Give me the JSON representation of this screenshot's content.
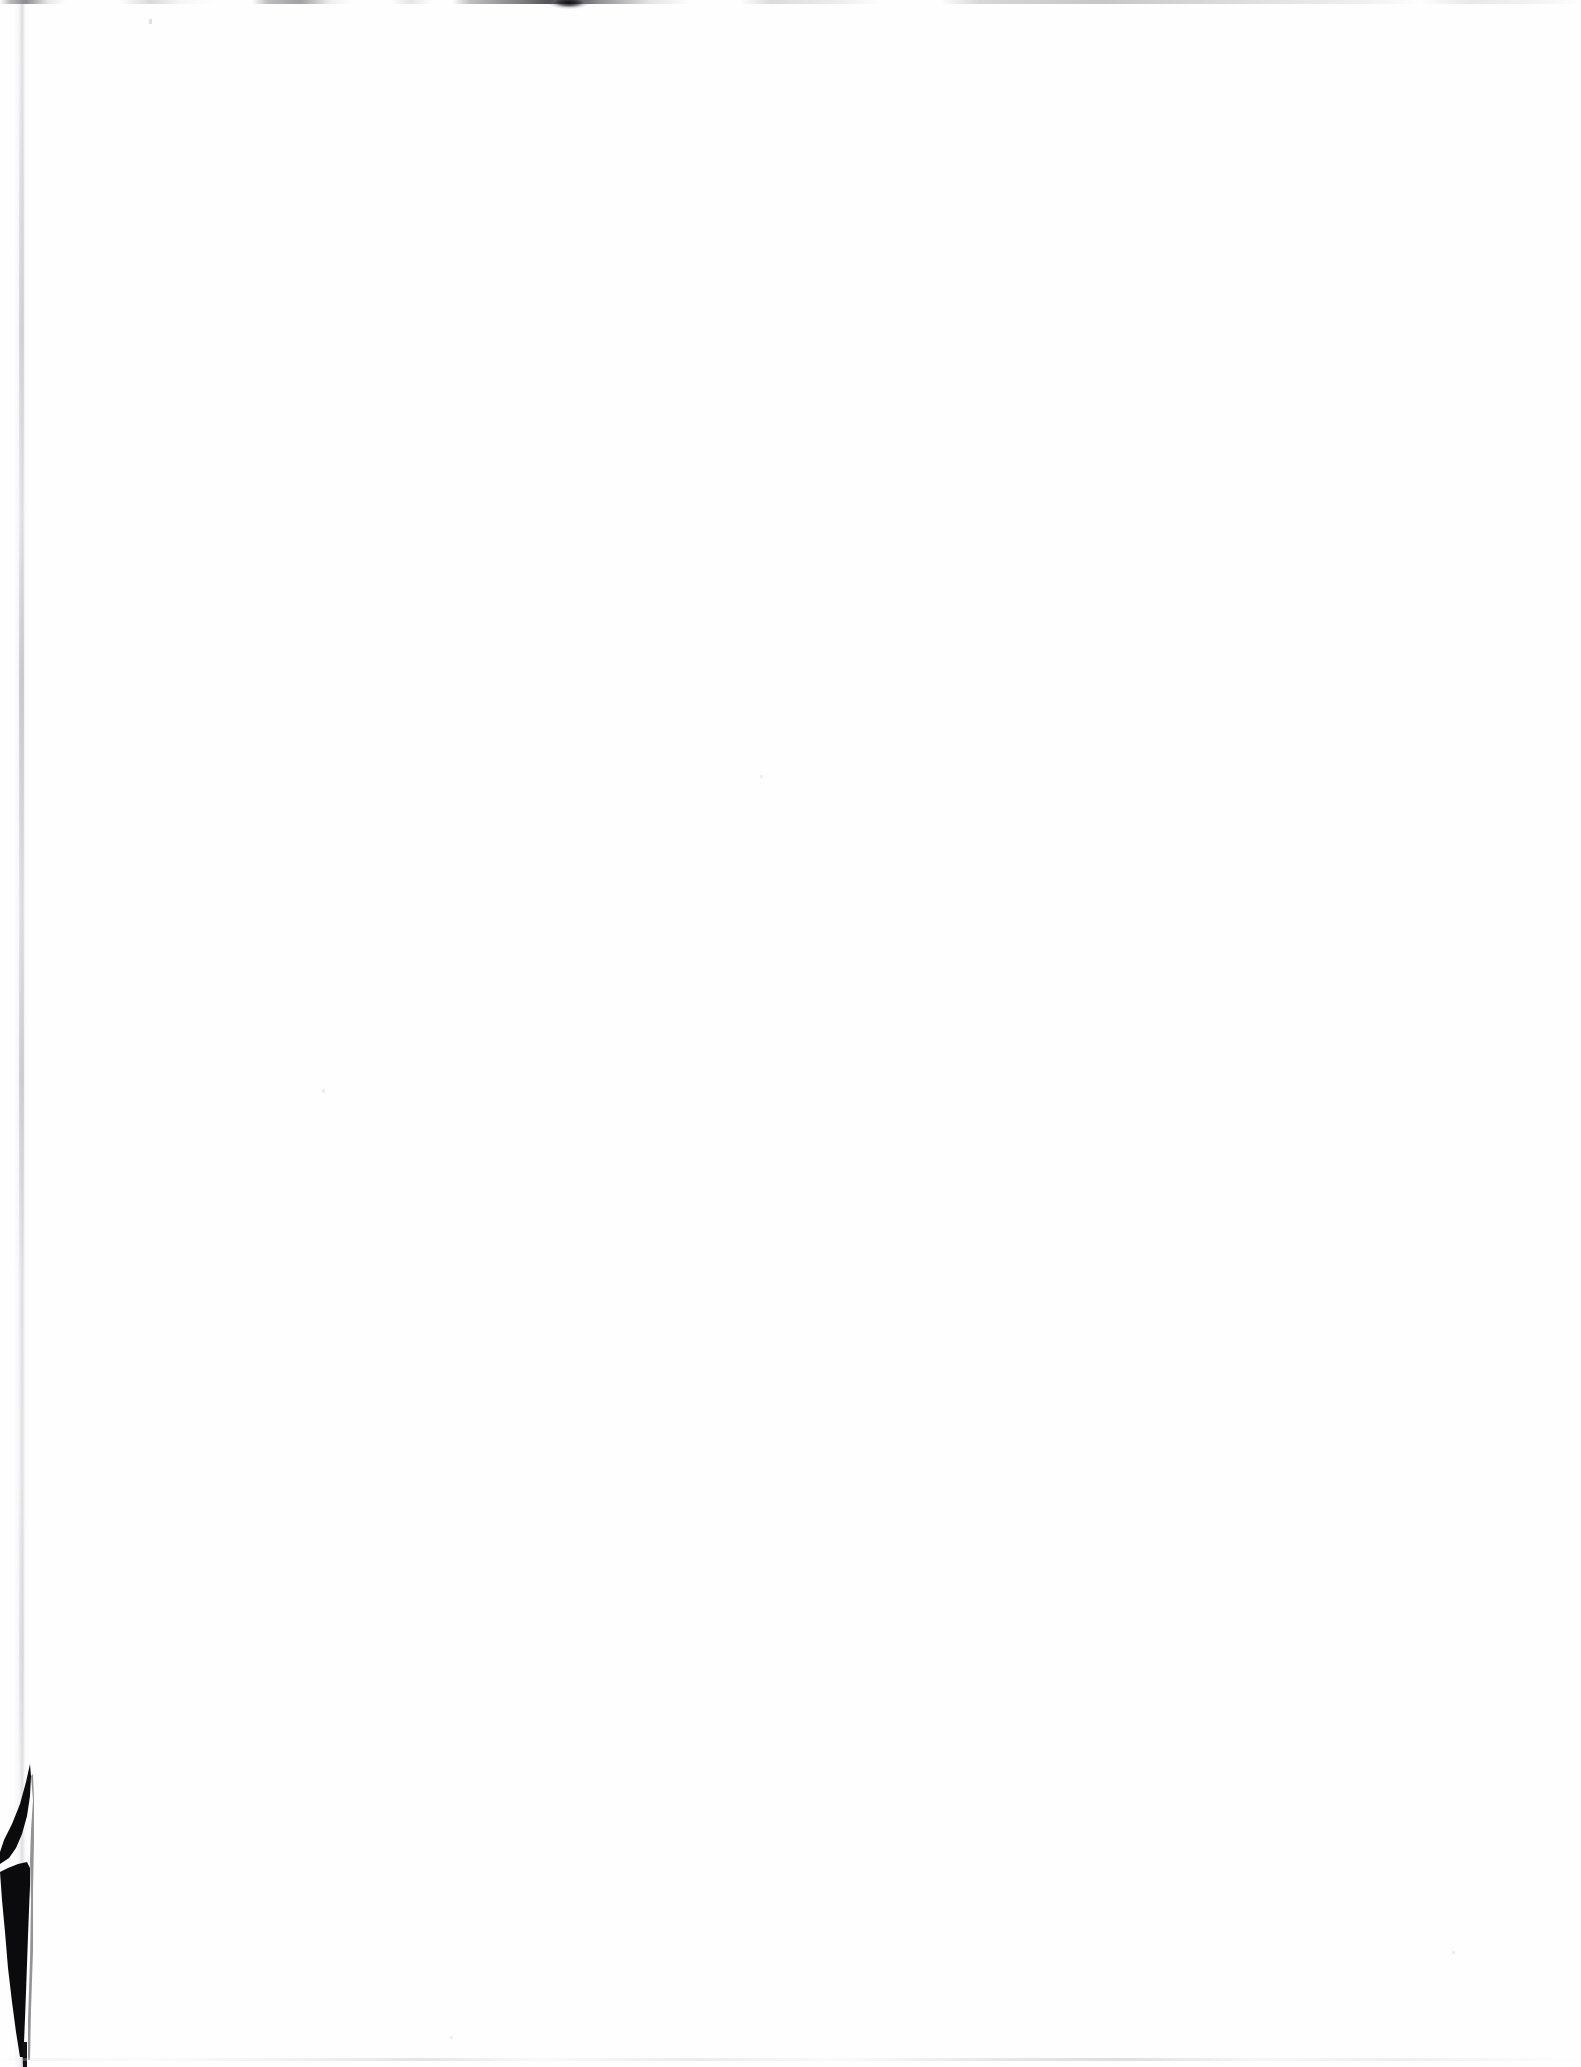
{
  "document": {
    "kind": "scanned-page",
    "orientation": "portrait",
    "page_width_px": 1581,
    "page_height_px": 2067,
    "content_text": "",
    "content_status": "This page intentionally contains no printed text or figures.",
    "visible_text_elements": []
  },
  "colors": {
    "canvas_white": "#ffffff",
    "paper_surface": "#fefefe",
    "artifact_black": "#0b0b0d",
    "artifact_gray": "#c8c8cc",
    "edge_shadow_gray": "#cacad0"
  },
  "artifacts": [
    {
      "id": "top-edge-line",
      "name": "top-edge-scan-line",
      "description": "Broken gray line of scanner noise along the extreme top edge of the page",
      "x": 0,
      "y": 0,
      "width": 1581,
      "height": 4,
      "tone": "gray"
    },
    {
      "id": "top-edge-blob",
      "name": "top-edge-dark-blob",
      "description": "Small dense dark smudge on the top edge",
      "x": 548,
      "y": 0,
      "width": 42,
      "height": 9,
      "tone": "black"
    },
    {
      "id": "top-speck",
      "name": "top-left-speck",
      "description": "Single faint dust speck below the top edge",
      "x": 149,
      "y": 19,
      "width": 3,
      "height": 5,
      "tone": "light-gray"
    },
    {
      "id": "left-edge-shadow",
      "name": "left-page-edge-shadow",
      "description": "Very faint vertical shadow marking the left paper edge, running the full page height",
      "x": 14,
      "y": 0,
      "width": 14,
      "height": 2067,
      "tone": "light-gray"
    },
    {
      "id": "corner-wedge",
      "name": "bottom-left-black-wedge",
      "description": "Solid black triangular sliver where the lower-left page corner lifted off the scanner platen",
      "x": 0,
      "y": 1760,
      "width": 64,
      "height": 307,
      "tone": "black"
    },
    {
      "id": "bottom-edge-line",
      "name": "bottom-edge-scan-line",
      "description": "Very faint gray line near the bottom edge of the scan",
      "x": 0,
      "y": 2058,
      "width": 1581,
      "height": 3,
      "tone": "light-gray"
    }
  ],
  "specks": [
    {
      "name": "field-speck-center",
      "x": 760,
      "y": 775,
      "width": 3,
      "height": 3
    },
    {
      "name": "field-speck-lower-left",
      "x": 322,
      "y": 1089,
      "width": 3,
      "height": 4
    },
    {
      "name": "field-speck-lower-right",
      "x": 1452,
      "y": 1951,
      "width": 3,
      "height": 3
    },
    {
      "name": "field-speck-bottom-mid",
      "x": 450,
      "y": 2036,
      "width": 3,
      "height": 3
    }
  ]
}
